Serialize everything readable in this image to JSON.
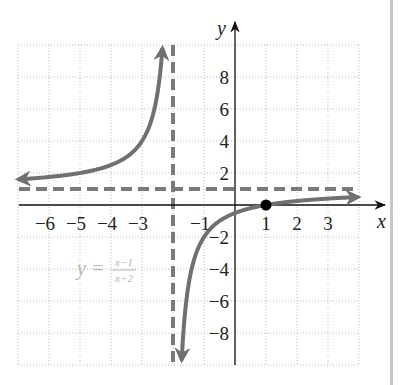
{
  "chart_data": {
    "type": "line",
    "title": "",
    "function": "y = (x-1)/(x+2)",
    "equation_label": {
      "lhs": "y =",
      "numerator": "x−1",
      "denominator": "x+2"
    },
    "xlabel": "x",
    "ylabel": "y",
    "xlim": [
      -7,
      4
    ],
    "ylim": [
      -10,
      10
    ],
    "grid": true,
    "x_ticks": [
      {
        "value": -6,
        "label": "−6"
      },
      {
        "value": -5,
        "label": "−5"
      },
      {
        "value": -4,
        "label": "−4"
      },
      {
        "value": -3,
        "label": "−3"
      },
      {
        "value": -1,
        "label": "−1"
      },
      {
        "value": 1,
        "label": "1"
      },
      {
        "value": 2,
        "label": "2"
      },
      {
        "value": 3,
        "label": "3"
      }
    ],
    "y_ticks": [
      {
        "value": 8,
        "label": "8"
      },
      {
        "value": 6,
        "label": "6"
      },
      {
        "value": 4,
        "label": "4"
      },
      {
        "value": 2,
        "label": "2"
      },
      {
        "value": -2,
        "label": "−2"
      },
      {
        "value": -4,
        "label": "−4"
      },
      {
        "value": -6,
        "label": "−6"
      },
      {
        "value": -8,
        "label": "−8"
      }
    ],
    "asymptotes": {
      "vertical": -2,
      "horizontal": 1
    },
    "marked_points": [
      {
        "x": 1,
        "y": 0,
        "label": "x-intercept"
      }
    ],
    "series": [
      {
        "name": "left branch",
        "x": [
          -7,
          -6,
          -5,
          -4,
          -3,
          -2.5,
          -2.333
        ],
        "y": [
          1.6,
          1.75,
          2,
          2.5,
          4,
          7,
          10
        ]
      },
      {
        "name": "right branch",
        "x": [
          -1.727,
          -1.5,
          -1,
          0,
          1,
          2,
          3,
          4
        ],
        "y": [
          -10,
          -5,
          -2,
          -0.5,
          0,
          0.25,
          0.4,
          0.5
        ]
      }
    ],
    "colors": {
      "curve": "#707070",
      "asymptote": "#7a7a7a",
      "grid": "#bdbdbd",
      "axis": "#111111",
      "point": "#000000",
      "equation": "#b5b5b5"
    }
  }
}
